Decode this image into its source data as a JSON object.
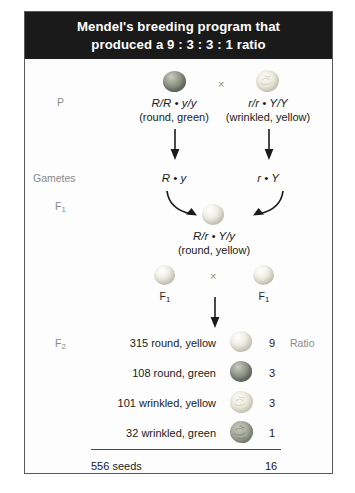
{
  "figure": {
    "title_line1": "Mendel's breeding program that",
    "title_line2": "produced a 9 : 3 : 3 : 1 ratio",
    "title_bg": "#1a1a1a",
    "title_color": "#ffffff",
    "border_color": "#595959",
    "label_color": "#8a8a8a",
    "text_color": "#1b1b1b"
  },
  "stage_labels": {
    "p": "P",
    "gametes": "Gametes",
    "f1": "F",
    "f1_sub": "1",
    "f2": "F",
    "f2_sub": "2"
  },
  "parental": {
    "cross_symbol": "×",
    "left": {
      "genotype": "R/R • y/y",
      "phenotype": "(round, green)",
      "seed": "round-green-seed",
      "gamete": "R • y"
    },
    "right": {
      "genotype": "r/r • Y/Y",
      "phenotype": "(wrinkled, yellow)",
      "seed": "wrinkled-yellow-seed",
      "gamete": "r • Y"
    }
  },
  "f1_generation": {
    "genotype": "R/r • Y/y",
    "phenotype": "(round, yellow)",
    "seed": "round-yellow-seed",
    "cross_symbol": "×",
    "left_tag": "F",
    "left_tag_sub": "1",
    "right_tag": "F",
    "right_tag_sub": "1"
  },
  "f2_generation": {
    "ratio_header": "Ratio",
    "rows": [
      {
        "count": "315",
        "description": "315 round, yellow",
        "seed": "round-yellow-seed",
        "ratio": "9"
      },
      {
        "count": "108",
        "description": "108 round, green",
        "seed": "round-green-seed",
        "ratio": "3"
      },
      {
        "count": "101",
        "description": "101 wrinkled, yellow",
        "seed": "wrinkled-yellow-seed",
        "ratio": "3"
      },
      {
        "count": "32",
        "description": "32 wrinkled, green",
        "seed": "wrinkled-green-seed",
        "ratio": "1"
      }
    ],
    "total_label": "556 seeds",
    "total_ratio": "16"
  }
}
